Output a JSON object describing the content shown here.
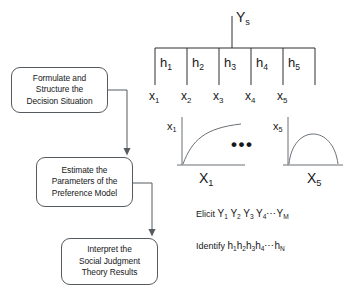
{
  "canvas": {
    "width": 347,
    "height": 301,
    "background": "#ffffff",
    "ink": "#16181a",
    "stroke": "#555a5e"
  },
  "flowchart": {
    "boxes": [
      {
        "name": "formulate",
        "lines": [
          "Formulate and",
          "Structure the",
          "Decision Situation"
        ]
      },
      {
        "name": "estimate",
        "lines": [
          "Estimate the",
          "Parameters of the",
          "Preference Model"
        ]
      },
      {
        "name": "interpret",
        "lines": [
          "Interpret the",
          "Social Judgment",
          "Theory Results"
        ]
      }
    ]
  },
  "tree": {
    "root_label": "Y",
    "root_sub": "s",
    "branches": [
      {
        "h": "h",
        "h_sub": "1",
        "x": "x",
        "x_sub": "1"
      },
      {
        "h": "h",
        "h_sub": "2",
        "x": "x",
        "x_sub": "2"
      },
      {
        "h": "h",
        "h_sub": "3",
        "x": "x",
        "x_sub": "3"
      },
      {
        "h": "h",
        "h_sub": "4",
        "x": "x",
        "x_sub": "4"
      },
      {
        "h": "h",
        "h_sub": "5",
        "x": "x",
        "x_sub": "5"
      }
    ]
  },
  "plots": [
    {
      "name": "plot-x1",
      "y_axis_label": "x",
      "y_axis_sub": "1",
      "x_axis_label": "X",
      "x_axis_sub": "1",
      "curve_shape": "concave-increasing"
    },
    {
      "name": "plot-x5",
      "y_axis_label": "x",
      "y_axis_sub": "5",
      "x_axis_label": "X",
      "x_axis_sub": "5",
      "curve_shape": "inverted-u"
    }
  ],
  "ellipsis": "•••",
  "statements": [
    {
      "name": "elicit",
      "verb": "Elicit",
      "terms": [
        {
          "base": "Y",
          "sub": "1"
        },
        {
          "base": "Y",
          "sub": "2"
        },
        {
          "base": "Y",
          "sub": "3"
        },
        {
          "base": "Y",
          "sub": "4"
        }
      ],
      "separator": "⋯",
      "last": {
        "base": "Y",
        "sub": "M"
      }
    },
    {
      "name": "identify",
      "verb": "Identify",
      "terms": [
        {
          "base": "h",
          "sub": "1"
        },
        {
          "base": "h",
          "sub": "2"
        },
        {
          "base": "h",
          "sub": "3"
        },
        {
          "base": "h",
          "sub": "4"
        }
      ],
      "separator": "⋯",
      "last": {
        "base": "h",
        "sub": "N"
      }
    }
  ]
}
